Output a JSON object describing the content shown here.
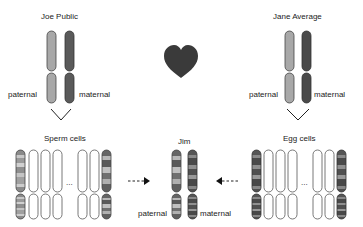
{
  "parents": {
    "father": {
      "name": "Joe Public",
      "left_label": "paternal",
      "right_label": "maternal"
    },
    "mother": {
      "name": "Jane Average",
      "left_label": "paternal",
      "right_label": "maternal"
    }
  },
  "heart_icon": "heart",
  "gametes": {
    "sperm": {
      "label": "Sperm cells",
      "ellipsis": "..."
    },
    "egg": {
      "label": "Egg cells",
      "ellipsis": "..."
    }
  },
  "child": {
    "name": "Jim",
    "left_label": "paternal",
    "right_label": "maternal"
  },
  "colors": {
    "light_chromosome": "#a8a8a8",
    "dark_chromosome": "#5a5a5a",
    "heart": "#3a3a3a",
    "outline": "#444444"
  }
}
